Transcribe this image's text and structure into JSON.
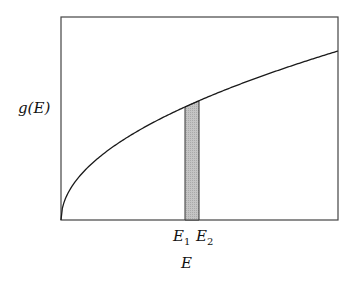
{
  "chart_data": {
    "type": "line",
    "title": "",
    "xlabel": "E",
    "ylabel": "g(E)",
    "curve": "g(E) ∝ √E",
    "x_range": [
      0,
      1
    ],
    "y_range": [
      0,
      1.2
    ],
    "grid": false,
    "legend": null,
    "shaded_region": {
      "from": "E1",
      "to": "E2",
      "fill": "#bdbdbd"
    },
    "x_tick_labels": [
      {
        "base": "E",
        "sub": "1"
      },
      {
        "base": "E",
        "sub": "2"
      }
    ],
    "series": [
      {
        "name": "g(E)",
        "x": [
          0,
          0.1,
          0.2,
          0.3,
          0.4,
          0.448,
          0.498,
          0.6,
          0.7,
          0.8,
          0.9,
          1.0
        ],
        "values": [
          0,
          0.316,
          0.447,
          0.548,
          0.632,
          0.669,
          0.706,
          0.775,
          0.837,
          0.894,
          0.949,
          1.0
        ]
      }
    ]
  },
  "labels": {
    "y_base": "g(E)",
    "e1_base": "E",
    "e1_sub": "1",
    "e2_base": "E",
    "e2_sub": "2",
    "x_axis": "E"
  },
  "colors": {
    "line": "#1a1a1a",
    "frame": "#444444",
    "shade": "#bdbdbd"
  }
}
